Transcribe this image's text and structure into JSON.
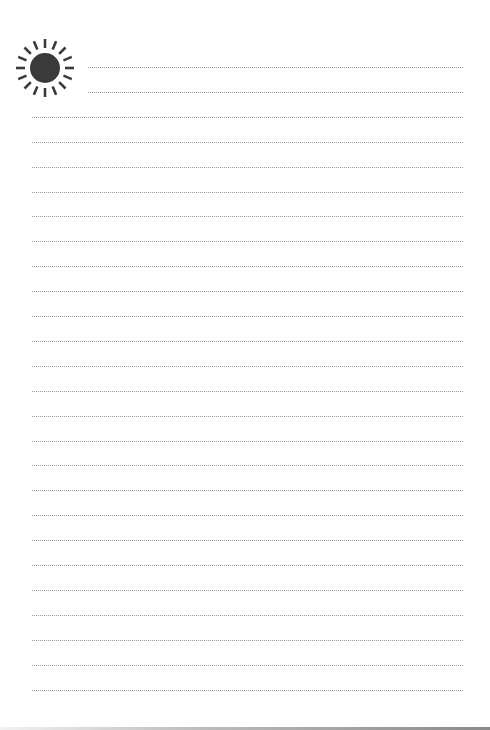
{
  "page": {
    "type": "lined-writing-paper",
    "icon": "sun-icon",
    "icon_color": "#3a3a3a",
    "line_color": "#9a9a9a",
    "line_count": 26,
    "short_line_count": 2
  }
}
